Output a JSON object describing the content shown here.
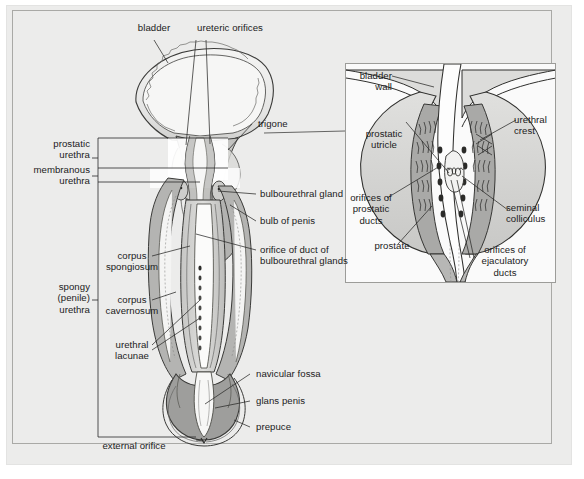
{
  "figure": {
    "background_color": "#ececeb",
    "plate_border_color": "#a9a9a6",
    "ink_color": "#1b1b1b",
    "tissue_fill_light": "#e9e9e8",
    "tissue_fill_mid": "#b9b9b7",
    "tissue_fill_dark": "#9a9a98",
    "lumen_fill": "#fdfdfd"
  },
  "main_diagram": {
    "labels": {
      "bladder": "bladder",
      "ureteric_orifices": "ureteric orifices",
      "trigone": "trigone",
      "prostatic_urethra": "prostatic\nurethra",
      "membranous_urethra": "membranous\nurethra",
      "spongy_urethra": "spongy\n(penile)\nurethra",
      "bulbourethral_gland": "bulbourethral gland",
      "bulb_of_penis": "bulb of penis",
      "orifice_of_duct": "orifice of duct of\nbulbourethral glands",
      "corpus_spongiosum": "corpus\nspongiosum",
      "corpus_cavernosum": "corpus\ncavernosum",
      "urethral_lacunae": "urethral\nlacunae",
      "navicular_fossa": "navicular fossa",
      "glans_penis": "glans penis",
      "prepuce": "prepuce",
      "external_orifice": "external orifice"
    }
  },
  "inset_diagram": {
    "labels": {
      "bladder_wall": "bladder\nwall",
      "prostatic_utricle": "prostatic\nutricle",
      "urethral_crest": "urethral\ncrest",
      "orifices_of_prostatic_ducts": "orifices of\nprostatic\nducts",
      "seminal_colliculus": "seminal\ncolliculus",
      "prostate": "prostate",
      "orifices_of_ejaculatory_ducts": "orifices of\nejaculatory\nducts"
    }
  }
}
